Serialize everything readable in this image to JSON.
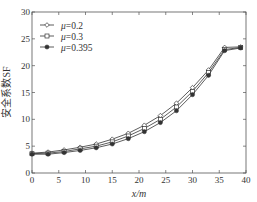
{
  "chart_data": {
    "type": "line",
    "title": "",
    "xlabel": "x/m",
    "ylabel": "安全系数SF",
    "xlim": [
      0,
      40
    ],
    "ylim": [
      0,
      30
    ],
    "xticks": [
      0,
      5,
      10,
      15,
      20,
      25,
      30,
      35,
      40
    ],
    "yticks": [
      0,
      5,
      10,
      15,
      20,
      25,
      30
    ],
    "grid": false,
    "legend_position": "upper left",
    "x": [
      0,
      3,
      6,
      9,
      12,
      15,
      18,
      21,
      24,
      27,
      30,
      33,
      36,
      39
    ],
    "series": [
      {
        "name": "μ=0.2",
        "marker": "diamond",
        "values": [
          3.7,
          3.9,
          4.3,
          4.8,
          5.4,
          6.3,
          7.4,
          8.9,
          10.7,
          13.0,
          15.9,
          19.2,
          23.4,
          23.5
        ]
      },
      {
        "name": "μ=0.3",
        "marker": "square",
        "values": [
          3.6,
          3.7,
          4.0,
          4.5,
          5.0,
          5.8,
          6.9,
          8.3,
          10.0,
          12.3,
          15.2,
          18.7,
          23.0,
          23.4
        ]
      },
      {
        "name": "μ=0.395",
        "marker": "star",
        "values": [
          3.5,
          3.5,
          3.8,
          4.2,
          4.7,
          5.4,
          6.4,
          7.7,
          9.4,
          11.6,
          14.6,
          18.2,
          22.8,
          23.3
        ]
      }
    ]
  },
  "legend": [
    {
      "label": "μ=0.2"
    },
    {
      "label": "μ=0.3"
    },
    {
      "label": "μ=0.395"
    }
  ]
}
